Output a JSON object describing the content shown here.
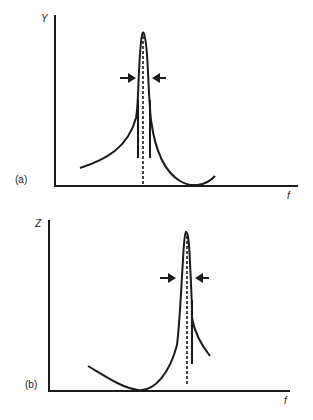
{
  "panels": [
    {
      "id": "a",
      "panel_label": "(a)",
      "y_axis_label": "Y",
      "x_axis_label": "f",
      "description": "Response peak with bandwidth arrows; resonance (dashed) followed by an anti-resonance minimum at higher f"
    },
    {
      "id": "b",
      "panel_label": "(b)",
      "y_axis_label": "Z",
      "x_axis_label": "f",
      "description": "Anti-resonance minimum at lower f followed by a sharp peak with bandwidth arrows"
    }
  ],
  "colors": {
    "line": "#1a1a1a",
    "background": "#ffffff"
  }
}
